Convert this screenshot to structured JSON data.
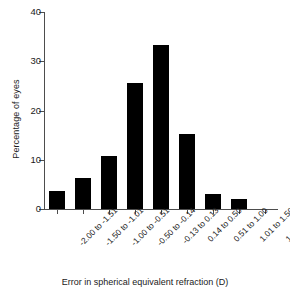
{
  "chart_data": {
    "type": "bar",
    "title": "",
    "xlabel": "Error in spherical equivalent refraction (D)",
    "ylabel": "Percentage of eyes",
    "categories": [
      "-2.00 to -1.51",
      "-1.50 to -1.01",
      "-1.00 to -0.51",
      "-0.50 to -0.14",
      "-0.13 to 0.13",
      "0.14 to 0.50",
      "0.51 to 1.00",
      "1.01 to 1.50",
      "1.51 to 2.00"
    ],
    "values": [
      3.6,
      6.3,
      10.8,
      25.6,
      33.3,
      15.3,
      3.0,
      2.0,
      0
    ],
    "ylim": [
      0,
      40
    ],
    "yticks": [
      0,
      10,
      20,
      30,
      40
    ],
    "ytick_labels": [
      "0",
      "10",
      "20",
      "30",
      "40"
    ],
    "grid": false,
    "legend": false,
    "bar_color": "#000000",
    "axis_color": "#4d4d4d"
  }
}
